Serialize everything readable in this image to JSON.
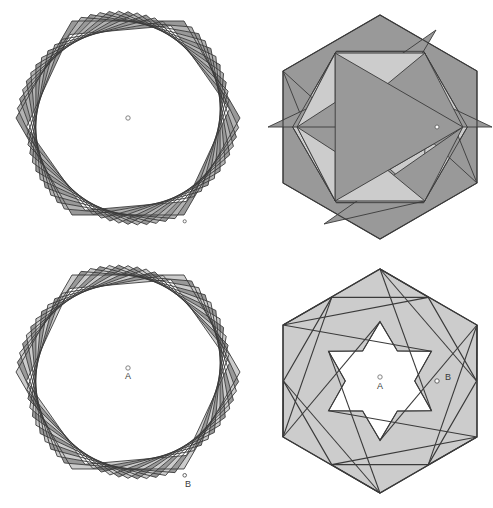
{
  "figure": {
    "background_color": "#ffffff",
    "stroke_color": "#3a3a3a",
    "stroke_width": 0.9,
    "fill_dark": "#999999",
    "fill_light": "#cccccc",
    "fill_none": "#ffffff",
    "marker_fill": "#ffffff",
    "marker_stroke": "#555555"
  },
  "panels": [
    {
      "id": "top-left",
      "name": "nested-rotated-hexagons-dark",
      "center": [
        128,
        118
      ],
      "outer_radius": 112,
      "hexagon_count": 12,
      "rotation_step_deg": 5,
      "shrink_ratio": 0.9914,
      "fill": "#999999",
      "fill_alternate": "#b3b3b3",
      "labels": [],
      "markers": [
        {
          "name": "center-marker",
          "x": 128,
          "y": 118,
          "r": 2.2,
          "label": ""
        },
        {
          "name": "vertex-marker-b",
          "x": 184.7,
          "y": 221.3,
          "r": 1.6,
          "label": ""
        }
      ]
    },
    {
      "id": "top-right",
      "name": "hexagram-inscribed-dark",
      "center": [
        380,
        127
      ],
      "outer_radius": 112,
      "fill": "#999999",
      "fill_light": "#cccccc",
      "labels": [],
      "markers": [
        {
          "name": "vertex-marker-b",
          "x": 437,
          "y": 127,
          "r": 2.0,
          "label": ""
        }
      ]
    },
    {
      "id": "bottom-left",
      "name": "nested-rotated-hexagons-light",
      "center": [
        128,
        372
      ],
      "outer_radius": 112,
      "hexagon_count": 12,
      "rotation_step_deg": 5,
      "shrink_ratio": 0.9914,
      "fill": "#cccccc",
      "fill_alternate": "#999999",
      "labels": [
        {
          "name": "label-a",
          "text": "A",
          "x": 128,
          "y": 378
        },
        {
          "name": "label-b",
          "text": "B",
          "x": 188,
          "y": 479
        }
      ],
      "markers": [
        {
          "name": "center-marker-a",
          "x": 128,
          "y": 368,
          "r": 2.2,
          "label": "A"
        },
        {
          "name": "vertex-marker-b",
          "x": 184.7,
          "y": 475.3,
          "r": 1.8,
          "label": "B"
        }
      ]
    },
    {
      "id": "bottom-right",
      "name": "hexagram-star-cutout-light",
      "center": [
        380,
        381
      ],
      "outer_radius": 112,
      "fill": "#cccccc",
      "star_fill": "#ffffff",
      "labels": [
        {
          "name": "label-a",
          "text": "A",
          "x": 380,
          "y": 388
        },
        {
          "name": "label-b",
          "text": "B",
          "x": 444,
          "y": 381
        }
      ],
      "markers": [
        {
          "name": "center-marker-a",
          "x": 380,
          "y": 378,
          "r": 2.2,
          "label": "A"
        },
        {
          "name": "vertex-marker-b",
          "x": 437,
          "y": 381,
          "r": 2.2,
          "label": "B"
        }
      ]
    }
  ],
  "chart_data": {
    "type": "diagram",
    "panel_labels": [
      "A",
      "B"
    ],
    "point_a_meaning": "center of hexagon",
    "point_b_meaning": "vertex of hexagon"
  }
}
